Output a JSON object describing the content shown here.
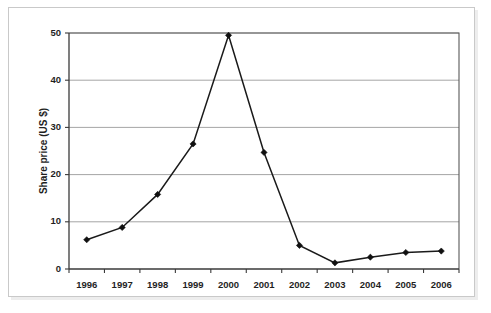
{
  "figure": {
    "caption": "",
    "background_color": "#ffffff",
    "frame_color": "#c9c9c9",
    "line_color": "#1a1a1a",
    "grid_color": "#9b9b9b"
  },
  "chart_data": {
    "type": "line",
    "title": "",
    "xlabel": "",
    "ylabel": "Share price (US $)",
    "categories": [
      "1996",
      "1997",
      "1998",
      "1999",
      "2000",
      "2001",
      "2002",
      "2003",
      "2004",
      "2005",
      "2006"
    ],
    "values": [
      6.2,
      8.8,
      15.8,
      26.5,
      49.5,
      24.7,
      5.0,
      1.3,
      2.5,
      3.5,
      3.8
    ],
    "series": [
      {
        "name": "Share price",
        "values": [
          6.2,
          8.8,
          15.8,
          26.5,
          49.5,
          24.7,
          5.0,
          1.3,
          2.5,
          3.5,
          3.8
        ],
        "marker": "diamond",
        "color": "#1a1a1a"
      }
    ],
    "ylim": [
      0,
      50
    ],
    "yticks": [
      0,
      10,
      20,
      30,
      40,
      50
    ],
    "ytick_labels": [
      "0",
      "10",
      "20",
      "30",
      "40",
      "50"
    ],
    "xtick_labels": [
      "1996",
      "1997",
      "1998",
      "1999",
      "2000",
      "2001",
      "2002",
      "2003",
      "2004",
      "2005",
      "2006"
    ],
    "grid": "horizontal",
    "legend": "none",
    "legend_position": "none"
  }
}
